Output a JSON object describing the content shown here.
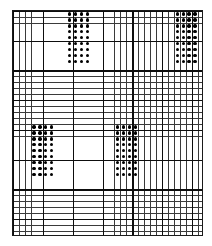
{
  "figure": {
    "type": "grid-dot-pattern",
    "background_color": "#ffffff",
    "minor_line_color": "#3a3a3a",
    "major_line_color": "#0d0d0d",
    "dot_color": "#000000",
    "grid": {
      "left": 12,
      "top": 10,
      "width": 191,
      "height": 226,
      "cell_width": 5.97,
      "cell_height": 5.95,
      "columns": 32,
      "rows": 38,
      "major_every": 5
    },
    "clusters": [
      {
        "name": "top-middle-cluster",
        "col": 9,
        "row": 0,
        "cols": 4,
        "rows": 9,
        "fill": "solid"
      },
      {
        "name": "top-right-cluster",
        "col": 27,
        "row": 0,
        "cols": 4,
        "rows": 9,
        "fill": "solid"
      },
      {
        "name": "bottom-left-cluster",
        "col": 3,
        "row": 19,
        "cols": 4,
        "rows": 9,
        "fill": "solid"
      },
      {
        "name": "bottom-center-cluster",
        "col": 17,
        "row": 19,
        "cols": 4,
        "rows": 9,
        "fill": "solid"
      }
    ]
  }
}
